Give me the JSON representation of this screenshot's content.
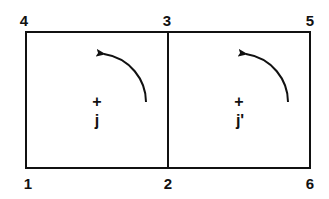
{
  "diagram": {
    "nodes": [
      {
        "id": "4",
        "label": "4"
      },
      {
        "id": "3",
        "label": "3"
      },
      {
        "id": "5",
        "label": "5"
      },
      {
        "id": "1",
        "label": "1"
      },
      {
        "id": "2",
        "label": "2"
      },
      {
        "id": "6",
        "label": "6"
      }
    ],
    "cells": [
      {
        "name": "left-cell",
        "corners": [
          "1",
          "2",
          "3",
          "4"
        ],
        "center_label": "j",
        "center_marker": "+",
        "arrow": "counter-clockwise"
      },
      {
        "name": "right-cell",
        "corners": [
          "2",
          "6",
          "5",
          "3"
        ],
        "center_label": "j'",
        "center_marker": "+",
        "arrow": "counter-clockwise"
      }
    ],
    "stroke_color": "#111111",
    "background": "#ffffff"
  }
}
